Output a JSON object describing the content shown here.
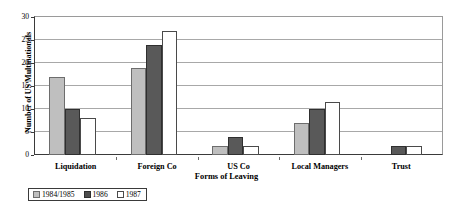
{
  "chart_data": {
    "type": "bar",
    "title": "",
    "subtitle": "",
    "xlabel": "Forms of Leaving",
    "ylabel": "Number of US Multinationals",
    "categories": [
      "Liquidation",
      "Foreign Co",
      "US Co",
      "Local Managers",
      "Trust"
    ],
    "series": [
      {
        "name": "1984/1985",
        "color": "#bfbfbf",
        "values": [
          17,
          19,
          2,
          7,
          0
        ]
      },
      {
        "name": "1986",
        "color": "#595959",
        "values": [
          10,
          24,
          4,
          10,
          2
        ]
      },
      {
        "name": "1987",
        "color": "#ffffff",
        "values": [
          8,
          27,
          2,
          11.5,
          2
        ]
      }
    ],
    "ylim": [
      0,
      30
    ],
    "yticks": [
      0,
      5,
      10,
      15,
      20,
      25,
      30
    ],
    "ytick_labels": [
      "0",
      "5",
      "10",
      "15",
      "20",
      "25",
      "30"
    ],
    "grid": true,
    "grid_axis": "y",
    "legend_position": "below-left",
    "legend_entries": [
      "1984/1985",
      "1986",
      "1987"
    ]
  }
}
